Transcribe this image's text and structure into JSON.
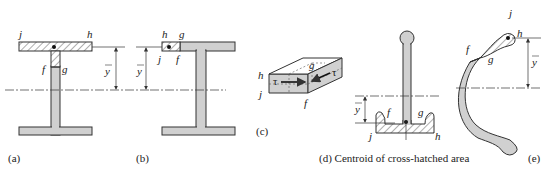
{
  "figure": {
    "panels": [
      {
        "id": "a",
        "caption": "(a)",
        "labels": {
          "j": "j",
          "h": "h",
          "f": "f",
          "g": "g",
          "ybar": "y"
        }
      },
      {
        "id": "b",
        "caption": "(b)",
        "labels": {
          "h": "h",
          "g": "g",
          "j": "j",
          "f": "f",
          "ybar": "y"
        }
      },
      {
        "id": "c",
        "caption": "(c)",
        "labels": {
          "h": "h",
          "j": "j",
          "g": "g",
          "f": "f",
          "tau1": "τ",
          "tau2": "τ"
        }
      },
      {
        "id": "d",
        "caption": "(d)  Centroid of cross-hatched area",
        "labels": {
          "f": "f",
          "g": "g",
          "j": "j",
          "h": "h",
          "ybar": "y"
        }
      },
      {
        "id": "e",
        "caption": "(e)",
        "labels": {
          "j": "j",
          "h": "h",
          "f": "f",
          "g": "g",
          "ybar": "y"
        }
      }
    ]
  },
  "colors": {
    "fill": "#d0d0d0",
    "stroke": "#333333"
  }
}
